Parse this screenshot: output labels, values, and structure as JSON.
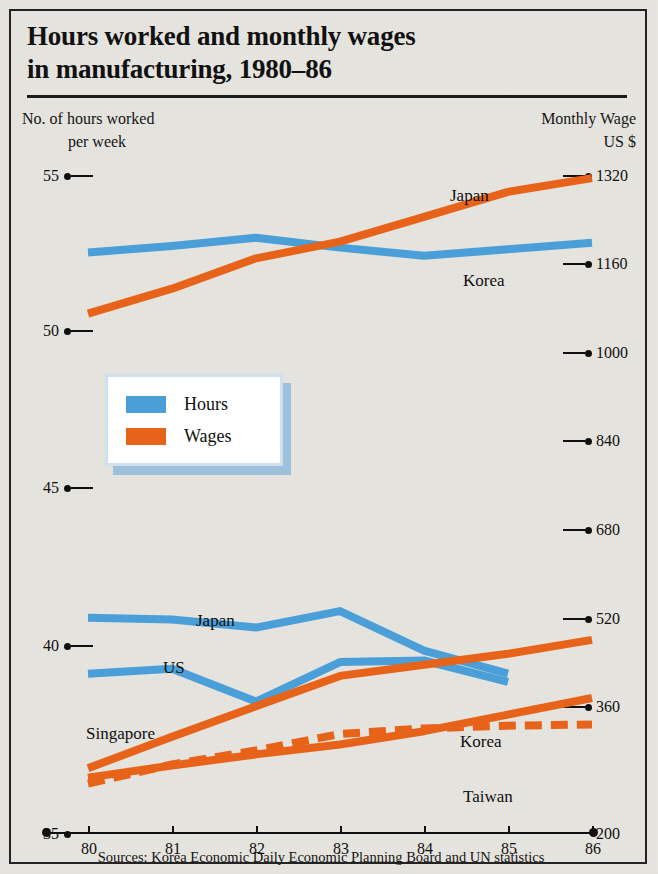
{
  "figure": {
    "title_line1": "Hours worked and monthly wages",
    "title_line2": "in manufacturing, 1980–86",
    "left_header_line1": "No. of hours worked",
    "left_header_line2": "per week",
    "right_header_line1": "Monthly Wage",
    "right_header_line2": "US $",
    "source": "Sources: Korea Economic Daily  Economic Planning Board and UN statistics",
    "colors": {
      "hours": "#4a9fd8",
      "wages": "#e8631a",
      "background": "#e8e6e0",
      "border": "#232323",
      "text": "#101010",
      "legend_shadow": "#9dc0dc"
    }
  },
  "legend": {
    "position": "center-left",
    "items": [
      {
        "label": "Hours",
        "color": "#4a9fd8"
      },
      {
        "label": "Wages",
        "color": "#e8631a"
      }
    ]
  },
  "chart_data": {
    "type": "line",
    "title": "Hours worked and monthly wages in manufacturing, 1980–86",
    "xlabel": "",
    "x": [
      80,
      81,
      82,
      83,
      84,
      85,
      86
    ],
    "xtick_labels": [
      "80",
      "81",
      "82",
      "83",
      "84",
      "85",
      "86"
    ],
    "xlim": [
      80,
      86
    ],
    "grid": false,
    "axes": [
      {
        "id": "left",
        "ylabel": "No. of hours worked per week",
        "ylim": [
          35,
          55
        ],
        "ytick_values": [
          35,
          40,
          45,
          50,
          55
        ],
        "ytick_labels": [
          "35",
          "40",
          "45",
          "50",
          "55"
        ]
      },
      {
        "id": "right",
        "ylabel": "Monthly Wage US $",
        "ylim": [
          200,
          1320
        ],
        "ytick_values": [
          200,
          360,
          520,
          680,
          840,
          1000,
          1160,
          1320
        ],
        "ytick_labels": [
          "200",
          "360",
          "520",
          "680",
          "840",
          "1000",
          "1160",
          "1320"
        ]
      }
    ],
    "series": [
      {
        "name": "Korea",
        "metric": "Hours",
        "axis": "left",
        "color": "#4a9fd8",
        "style": "solid",
        "label": "Korea",
        "values": [
          52.4,
          52.6,
          52.85,
          52.55,
          52.3,
          52.5,
          52.7
        ]
      },
      {
        "name": "Japan",
        "metric": "Hours",
        "axis": "left",
        "color": "#4a9fd8",
        "style": "solid",
        "label": "Japan",
        "values": [
          41.3,
          41.25,
          41.0,
          41.5,
          40.3,
          39.6,
          null
        ]
      },
      {
        "name": "US",
        "metric": "Hours",
        "axis": "left",
        "color": "#4a9fd8",
        "style": "solid",
        "label": "US",
        "values": [
          39.6,
          39.75,
          38.75,
          39.95,
          40.0,
          39.35,
          null
        ]
      },
      {
        "name": "Japan",
        "metric": "Wages",
        "axis": "right",
        "color": "#e8631a",
        "style": "solid",
        "label": "Japan",
        "values": [
          1055,
          1100,
          1155,
          1185,
          1230,
          1275,
          1300
        ]
      },
      {
        "name": "Singapore",
        "metric": "Wages",
        "axis": "right",
        "color": "#e8631a",
        "style": "solid",
        "label": "Singapore",
        "values": [
          233,
          290,
          345,
          400,
          420,
          440,
          465
        ]
      },
      {
        "name": "Korea",
        "metric": "Wages",
        "axis": "right",
        "color": "#e8631a",
        "style": "solid",
        "label": "Korea",
        "values": [
          216,
          238,
          258,
          276,
          300,
          330,
          360
        ]
      },
      {
        "name": "Taiwan",
        "metric": "Wages",
        "axis": "right",
        "color": "#e8631a",
        "style": "dashed",
        "label": "Taiwan",
        "values": [
          205,
          240,
          265,
          295,
          305,
          310,
          312
        ]
      }
    ],
    "annotations": [
      {
        "text": "Japan",
        "x": 450,
        "y": 196
      },
      {
        "text": "Korea",
        "x": 463,
        "y": 281
      },
      {
        "text": "Japan",
        "x": 196,
        "y": 621
      },
      {
        "text": "US",
        "x": 163,
        "y": 668
      },
      {
        "text": "Singapore",
        "x": 86,
        "y": 734
      },
      {
        "text": "Korea",
        "x": 460,
        "y": 742
      },
      {
        "text": "Taiwan",
        "x": 463,
        "y": 797
      }
    ]
  },
  "ticks": {
    "left": [
      {
        "label": "55",
        "top": 167
      },
      {
        "label": "50",
        "top": 322
      },
      {
        "label": "45",
        "top": 479
      },
      {
        "label": "40",
        "top": 637
      },
      {
        "label": "35",
        "top": 825
      }
    ],
    "right": [
      {
        "label": "1320",
        "top": 167
      },
      {
        "label": "1160",
        "top": 255
      },
      {
        "label": "1000",
        "top": 344
      },
      {
        "label": "840",
        "top": 432
      },
      {
        "label": "680",
        "top": 521
      },
      {
        "label": "520",
        "top": 610
      },
      {
        "label": "360",
        "top": 698
      },
      {
        "label": "200",
        "top": 825
      }
    ],
    "x": [
      {
        "label": "80",
        "left": 88
      },
      {
        "label": "81",
        "left": 172
      },
      {
        "label": "82",
        "left": 256
      },
      {
        "label": "83",
        "left": 340
      },
      {
        "label": "84",
        "left": 424
      },
      {
        "label": "85",
        "left": 508
      },
      {
        "label": "86",
        "left": 592
      }
    ]
  }
}
